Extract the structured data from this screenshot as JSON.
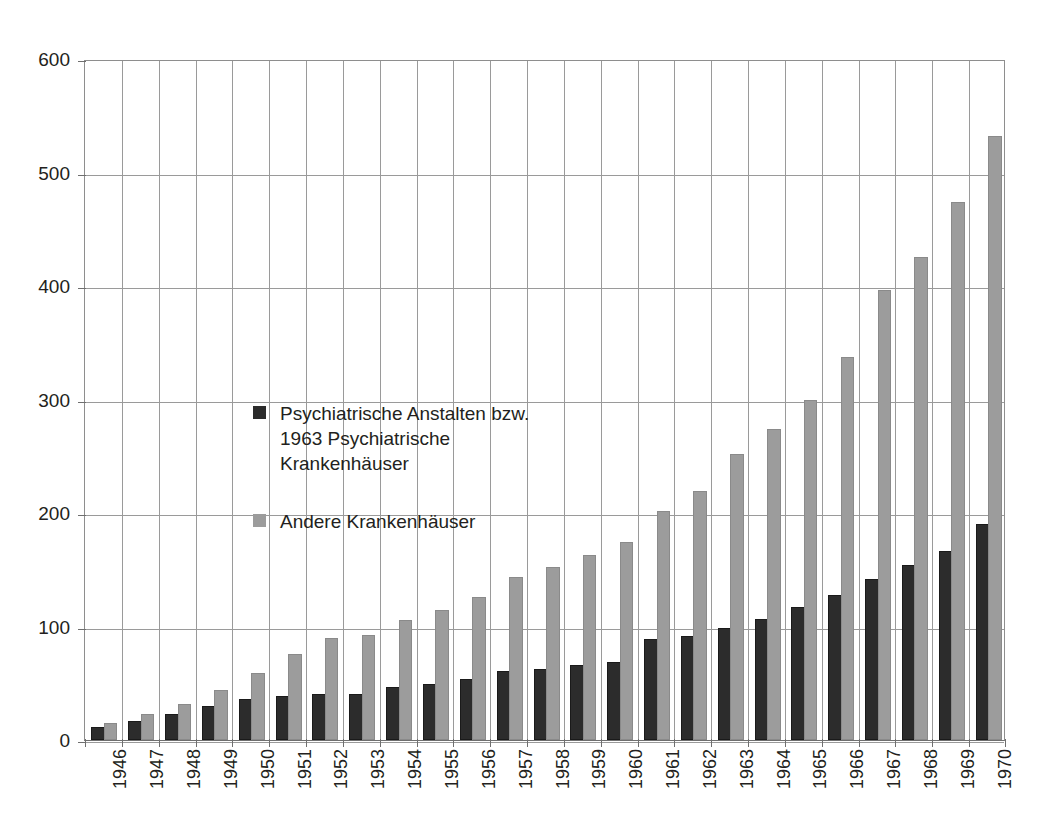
{
  "top_remnant": "clipped header text",
  "chart_data": {
    "type": "bar",
    "title": "",
    "subtitle": "",
    "xlabel": "",
    "ylabel": "",
    "ylim": [
      0,
      600
    ],
    "yticks": [
      0,
      100,
      200,
      300,
      400,
      500,
      600
    ],
    "grid": true,
    "legend_position": "inside-upper-left",
    "categories": [
      "1946",
      "1947",
      "1948",
      "1949",
      "1950",
      "1951",
      "1952",
      "1953",
      "1954",
      "1955",
      "1956",
      "1957",
      "1958",
      "1959",
      "1960",
      "1961",
      "1962",
      "1963",
      "1964",
      "1965",
      "1966",
      "1967",
      "1968",
      "1969",
      "1970"
    ],
    "series": [
      {
        "name": "Psychiatrische Anstalten bzw. ab\n1963 Psychiatrische Krankenhäuser",
        "color": "#2c2c2c",
        "values": [
          10,
          15,
          21,
          28,
          34,
          37,
          39,
          39,
          45,
          48,
          52,
          59,
          61,
          64,
          67,
          87,
          90,
          97,
          105,
          115,
          126,
          140,
          152,
          165,
          189
        ]
      },
      {
        "name": "Andere Krankenhäuser",
        "color": "#9c9c9c",
        "values": [
          13,
          21,
          30,
          42,
          57,
          74,
          88,
          91,
          104,
          113,
          124,
          142,
          151,
          161,
          173,
          200,
          218,
          250,
          272,
          298,
          336,
          395,
          424,
          472,
          530
        ]
      }
    ]
  },
  "legend": {
    "entries": [
      {
        "label": "Psychiatrische Anstalten bzw.\n1963 Psychiatrische Krankenhäuser",
        "swatch": "dark"
      },
      {
        "label": "Andere Krankenhäuser",
        "swatch": "light"
      }
    ]
  },
  "colors": {
    "dark_series": "#2c2c2c",
    "light_series": "#9c9c9c",
    "grid": "#9a9a9a",
    "axis": "#6f6f6f",
    "text": "#231f20",
    "background": "#ffffff"
  }
}
